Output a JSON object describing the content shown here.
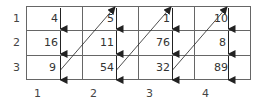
{
  "diagram": {
    "row_labels": [
      "1",
      "2",
      "3"
    ],
    "col_labels": [
      "1",
      "2",
      "3",
      "4"
    ],
    "cells": [
      [
        "4",
        "5",
        "1",
        "10"
      ],
      [
        "16",
        "11",
        "76",
        "8"
      ],
      [
        "9",
        "54",
        "32",
        "89"
      ]
    ],
    "traversal": "column-major (down each column, diagonal back to top of next column)",
    "colors": {
      "line": "#555555",
      "arrow": "#222222",
      "background": "#ffffff"
    }
  }
}
